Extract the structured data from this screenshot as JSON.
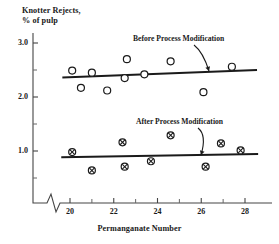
{
  "chart_data": {
    "type": "scatter",
    "title": "",
    "ylabel_line1": "Knotter Rejects,",
    "ylabel_line2": "% of pulp",
    "xlabel": "Permanganate Number",
    "xlim": [
      19.2,
      28.8
    ],
    "ylim": [
      0.0,
      3.2
    ],
    "xticks": [
      20,
      22,
      24,
      26,
      28
    ],
    "xtick_labels": [
      "20",
      "22",
      "24",
      "26",
      "28"
    ],
    "xminor_ticks": [
      21,
      23,
      25,
      27
    ],
    "yticks": [
      1.0,
      2.0,
      3.0
    ],
    "ytick_labels": [
      "1.0",
      "2.0",
      "3.0"
    ],
    "yminor_ticks": [
      0.5,
      1.5,
      2.5
    ],
    "grid": false,
    "axis_break_x": true,
    "legend_position": "inline-annotations",
    "annotations": [
      {
        "text": "Before Process Modification",
        "x": 25.0,
        "y": 3.05
      },
      {
        "text": "After Process Modification",
        "x": 25.2,
        "y": 1.52
      }
    ],
    "series": [
      {
        "name": "Before Process Modification",
        "marker": "open-circle",
        "color": "#1a1a1a",
        "points": [
          {
            "x": 20.1,
            "y": 2.49
          },
          {
            "x": 20.5,
            "y": 2.17
          },
          {
            "x": 21.0,
            "y": 2.45
          },
          {
            "x": 21.7,
            "y": 2.12
          },
          {
            "x": 22.5,
            "y": 2.35
          },
          {
            "x": 22.6,
            "y": 2.7
          },
          {
            "x": 23.4,
            "y": 2.42
          },
          {
            "x": 24.6,
            "y": 2.66
          },
          {
            "x": 26.1,
            "y": 2.09
          },
          {
            "x": 27.4,
            "y": 2.56
          }
        ],
        "trend_line": {
          "x0": 19.65,
          "y0": 2.36,
          "x1": 28.55,
          "y1": 2.5
        }
      },
      {
        "name": "After Process Modification",
        "marker": "crossed-circle",
        "color": "#1a1a1a",
        "points": [
          {
            "x": 20.1,
            "y": 0.98
          },
          {
            "x": 21.0,
            "y": 0.64
          },
          {
            "x": 22.4,
            "y": 1.16
          },
          {
            "x": 22.5,
            "y": 0.71
          },
          {
            "x": 23.7,
            "y": 0.81
          },
          {
            "x": 24.6,
            "y": 1.29
          },
          {
            "x": 26.2,
            "y": 0.71
          },
          {
            "x": 26.9,
            "y": 1.14
          },
          {
            "x": 27.8,
            "y": 1.01
          }
        ],
        "trend_line": {
          "x0": 19.6,
          "y0": 0.885,
          "x1": 28.6,
          "y1": 0.945
        }
      }
    ]
  }
}
